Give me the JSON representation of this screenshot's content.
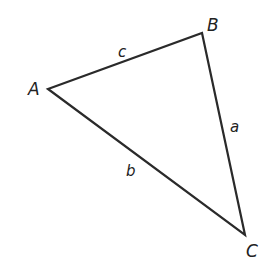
{
  "diagram": {
    "type": "triangle",
    "vertices": [
      {
        "name": "A",
        "x": 48,
        "y": 89
      },
      {
        "name": "B",
        "x": 202,
        "y": 33
      },
      {
        "name": "C",
        "x": 245,
        "y": 235
      }
    ],
    "vertex_labels": {
      "A": "A",
      "B": "B",
      "C": "C"
    },
    "side_labels": {
      "a": "a",
      "b": "b",
      "c": "c"
    },
    "stroke_color": "#2a2a2a"
  }
}
